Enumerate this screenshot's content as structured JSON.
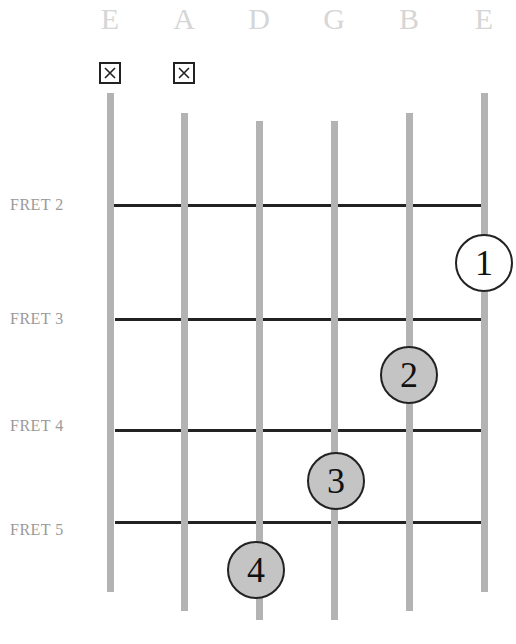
{
  "diagram": {
    "type": "guitar-chord-chart",
    "strings": [
      {
        "name": "E",
        "x": 110,
        "top": 93,
        "bottom": 592,
        "muted": true
      },
      {
        "name": "A",
        "x": 184,
        "top": 113,
        "bottom": 611,
        "muted": true
      },
      {
        "name": "D",
        "x": 259,
        "top": 121,
        "bottom": 620,
        "muted": false
      },
      {
        "name": "G",
        "x": 334,
        "top": 121,
        "bottom": 620,
        "muted": false
      },
      {
        "name": "B",
        "x": 409,
        "top": 113,
        "bottom": 611,
        "muted": false
      },
      {
        "name": "E",
        "x": 484,
        "top": 93,
        "bottom": 592,
        "muted": false
      }
    ],
    "muted_symbol": "☒",
    "frets": [
      {
        "label": "FRET 2",
        "y": 205
      },
      {
        "label": "FRET 3",
        "y": 319
      },
      {
        "label": "FRET 4",
        "y": 430
      },
      {
        "label": "FRET 5",
        "y": 522
      }
    ],
    "fingers": [
      {
        "number": "1",
        "string": "E (high)",
        "x": 484,
        "y": 263,
        "fill": "#ffffff"
      },
      {
        "number": "2",
        "string": "B",
        "x": 409,
        "y": 375,
        "fill": "#c4c4c4"
      },
      {
        "number": "3",
        "string": "G",
        "x": 336,
        "y": 481,
        "fill": "#c4c4c4"
      },
      {
        "number": "4",
        "string": "D",
        "x": 256,
        "y": 570,
        "fill": "#c4c4c4"
      }
    ],
    "colors": {
      "string": "#b3b3b3",
      "fret": "#222222",
      "string_label": "#d6d6d6",
      "fret_label": "#9a9a9a",
      "finger_fill": "#c4c4c4"
    }
  }
}
